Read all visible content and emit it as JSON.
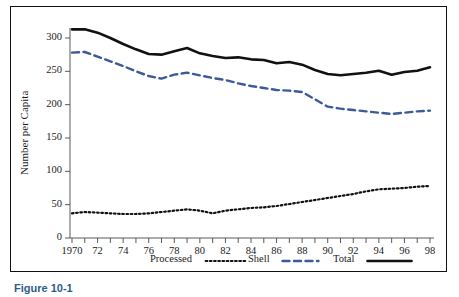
{
  "figure": {
    "caption_partial": "Figure 10-1"
  },
  "chart_data": {
    "type": "line",
    "title": "",
    "xlabel": "",
    "ylabel": "Number per Capita",
    "xlim": [
      1970,
      1998
    ],
    "ylim": [
      0,
      300
    ],
    "yticks": [
      0,
      50,
      100,
      150,
      200,
      250,
      300
    ],
    "ytick_labels": [
      "0",
      "50",
      "100",
      "150",
      "200",
      "250",
      "300"
    ],
    "x": [
      1970,
      1971,
      1972,
      1973,
      1974,
      1975,
      1976,
      1977,
      1978,
      1979,
      1980,
      1981,
      1982,
      1983,
      1984,
      1985,
      1986,
      1987,
      1988,
      1989,
      1990,
      1991,
      1992,
      1993,
      1994,
      1995,
      1996,
      1997,
      1998
    ],
    "xtick_values": [
      1970,
      1971,
      1972,
      1973,
      1974,
      1975,
      1976,
      1977,
      1978,
      1979,
      1980,
      1981,
      1982,
      1983,
      1984,
      1985,
      1986,
      1987,
      1988,
      1989,
      1990,
      1991,
      1992,
      1993,
      1994,
      1995,
      1996,
      1997,
      1998
    ],
    "xtick_labels": [
      "1970",
      "",
      "72",
      "",
      "74",
      "",
      "76",
      "",
      "78",
      "",
      "80",
      "",
      "82",
      "",
      "84",
      "",
      "86",
      "",
      "88",
      "",
      "90",
      "",
      "92",
      "",
      "94",
      "",
      "96",
      "",
      "98"
    ],
    "grid": false,
    "legend_position": "below-axis",
    "series": [
      {
        "name": "Processed",
        "style": "dotted",
        "color": "#111111",
        "values": [
          37,
          39,
          38,
          37,
          36,
          36,
          37,
          39,
          41,
          43,
          41,
          37,
          41,
          43,
          45,
          46,
          48,
          51,
          54,
          57,
          60,
          63,
          66,
          70,
          73,
          74,
          75,
          77,
          78
        ]
      },
      {
        "name": "Shell",
        "style": "dashed",
        "color": "#3c5a99",
        "values": [
          278,
          279,
          272,
          265,
          258,
          250,
          243,
          239,
          245,
          248,
          244,
          240,
          237,
          232,
          228,
          225,
          222,
          221,
          219,
          208,
          197,
          194,
          192,
          190,
          188,
          186,
          188,
          190,
          191
        ]
      },
      {
        "name": "Total",
        "style": "solid",
        "color": "#111111",
        "values": [
          313,
          313,
          308,
          300,
          291,
          283,
          276,
          275,
          280,
          285,
          277,
          273,
          270,
          271,
          268,
          267,
          262,
          264,
          260,
          252,
          246,
          244,
          246,
          248,
          251,
          245,
          249,
          251,
          256
        ]
      }
    ]
  },
  "legend": {
    "items": [
      {
        "label": "Processed",
        "swatch": "dotted-line"
      },
      {
        "label": "Shell",
        "swatch": "dashed-line"
      },
      {
        "label": "Total",
        "swatch": "solid-line"
      }
    ]
  },
  "colors": {
    "shell_blue": "#3c5a99",
    "ink": "#111111",
    "background": "#ffffff",
    "caption_blue": "#2e5c8a"
  }
}
